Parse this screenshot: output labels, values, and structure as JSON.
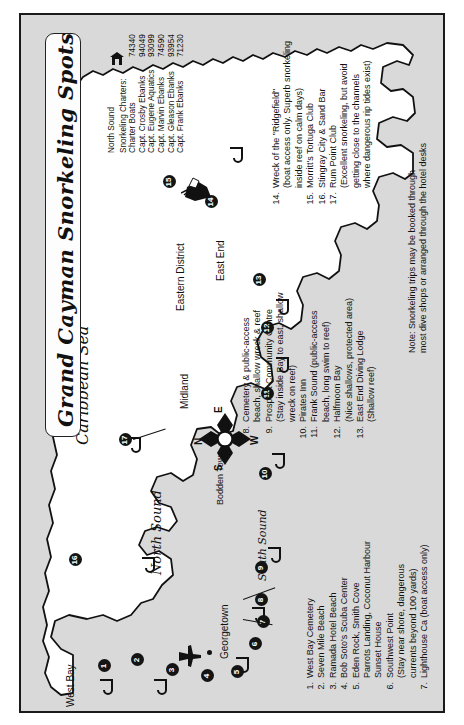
{
  "map": {
    "title": "Grand Cayman Snorkeling Spots",
    "sea_label": "Caribbean Sea",
    "water_labels": [
      "North Sound",
      "South Sound"
    ],
    "region_labels": [
      "West Bay",
      "Georgetown",
      "Bodden Town",
      "Midland",
      "Eastern District",
      "East End"
    ],
    "compass": {
      "n": "N",
      "e": "E",
      "s": "S",
      "w": "W"
    },
    "icons": {
      "airport": "airplane-icon",
      "wreck": "shipwreck-icon",
      "charter_hut": "hut-icon",
      "snorkel": "fish-hook-icon",
      "compass_rose": "compass-rose-icon"
    },
    "markers": [
      "1",
      "2",
      "3",
      "4",
      "5",
      "6",
      "7",
      "8",
      "9",
      "10",
      "11",
      "12",
      "13",
      "14",
      "15",
      "16",
      "17"
    ]
  },
  "charters": {
    "area_label": "North Sound",
    "heading": "Snorkeling Charters:",
    "rows": [
      {
        "name": "Charter Boats",
        "phone": "74340"
      },
      {
        "name": "Capt. Crosby Ebanks",
        "phone": "94049"
      },
      {
        "name": "Capt. Eugene Aquatics",
        "phone": "93099"
      },
      {
        "name": "Capt. Marvin Ebanks",
        "phone": "74590"
      },
      {
        "name": "Capt. Gleason Ebanks",
        "phone": "93954"
      },
      {
        "name": "Capt. Frank Ebanks",
        "phone": "71230"
      }
    ]
  },
  "legend_left": [
    {
      "num": "1.",
      "text": "West Bay Cemetery"
    },
    {
      "num": "2.",
      "text": "Seven Mile Beach"
    },
    {
      "num": "3.",
      "text": "Ramada Hotel Beach"
    },
    {
      "num": "4.",
      "text": "Bob Soto's Scuba Center"
    },
    {
      "num": "5.",
      "text": "Eden Rock, Smith Cove\nParrots Landing, Coconut Harbour\nSunset House"
    },
    {
      "num": "6.",
      "text": "Southwest Point\n(Stay near shore, dangerous\ncurrents beyond 100 yards)"
    },
    {
      "num": "7.",
      "text": "Lighthouse Ca (boat access only)"
    }
  ],
  "legend_mid": [
    {
      "num": "8.",
      "text": "Cemetery & public-access\nbeach, shallow wreck & reef"
    },
    {
      "num": "9.",
      "text": "Prospect Community Centre\n(Stay inside Bay to east, shallow\nwreck on reef)"
    },
    {
      "num": "10.",
      "text": "Pirates Inn"
    },
    {
      "num": "11.",
      "text": "Frank Sound (public-access\nbeach, long swim to reef)"
    },
    {
      "num": "12.",
      "text": "Halfmoon Bay\n(Nice shallows, protected area)"
    },
    {
      "num": "13.",
      "text": "East End Diving Lodge\n(Shallow reef)"
    }
  ],
  "legend_right": [
    {
      "num": "14.",
      "text": "Wreck of the \"Ridgefield\"\n(boat access only. Superb snorkeling\ninside reef on calm days)"
    },
    {
      "num": "15.",
      "text": "Morritt's Tortuga Club"
    },
    {
      "num": "16.",
      "text": "Stingray City & Sand Bar"
    },
    {
      "num": "17.",
      "text": "Rum Point Club\n(Excellent snorkeling, but avoid\ngetting close to the channels\nwhere dangerous rip tides exist)"
    }
  ],
  "note": "Note: Snorkeling trips may be booked through\nmost dive shops or arranged through the hotel desks"
}
